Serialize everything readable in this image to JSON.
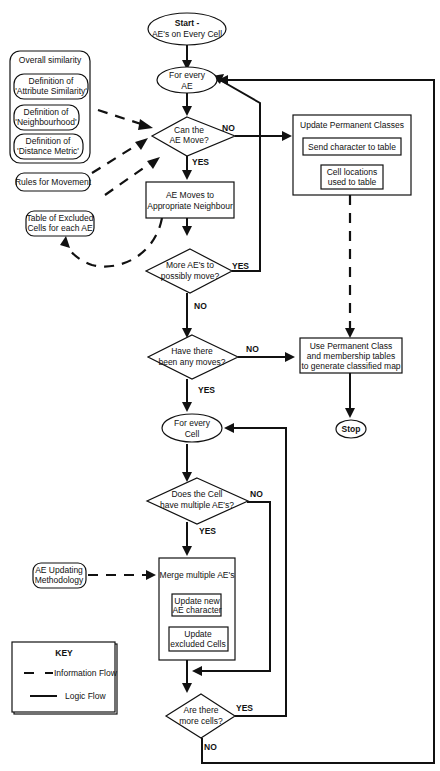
{
  "diagram": {
    "nodes": {
      "start": {
        "line1": "Start -",
        "line2": "AE's on Every Cell"
      },
      "for_every_ae": {
        "line1": "For every",
        "line2": "AE"
      },
      "can_ae_move": {
        "line1": "Can the",
        "line2": "AE Move?"
      },
      "ae_moves": {
        "line1": "AE Moves to",
        "line2": "Appropriate Neighbour"
      },
      "more_aes": {
        "line1": "More AE's to",
        "line2": "possibly move?"
      },
      "any_moves": {
        "line1": "Have there",
        "line2": "been any moves?"
      },
      "update_perm": {
        "title": "Update Permanent Classes",
        "sub1": "Send character to table",
        "sub2_line1": "Cell locations",
        "sub2_line2": "used to table"
      },
      "use_perm": {
        "line1": "Use Permanent Class",
        "line2": "and membership tables",
        "line3": "to generate classified map"
      },
      "stop": {
        "label": "Stop"
      },
      "for_every_cell": {
        "line1": "For every",
        "line2": "Cell"
      },
      "multi_aes": {
        "line1": "Does the Cell",
        "line2": "have multiple AE's?"
      },
      "merge": {
        "title": "Merge multiple AE's",
        "sub1_line1": "Update new",
        "sub1_line2": "AE character",
        "sub2_line1": "Update",
        "sub2_line2": "excluded Cells"
      },
      "more_cells": {
        "line1": "Are there",
        "line2": "more cells?"
      }
    },
    "inputs": {
      "overall": {
        "title": "Overall similarity",
        "items": [
          {
            "line1": "Definition of",
            "line2": "'Attribute Similarity'"
          },
          {
            "line1": "Definition of",
            "line2": "'Neighbourhood'"
          },
          {
            "line1": "Definition of",
            "line2": "'Distance Metric'"
          }
        ]
      },
      "rules": "Rules for Movement",
      "excluded": {
        "line1": "Table of Excluded",
        "line2": "Cells for each AE"
      },
      "ae_updating": {
        "line1": "AE Updating",
        "line2": "Methodology"
      }
    },
    "edge_labels": {
      "can_move_no": "NO",
      "can_move_yes": "YES",
      "more_aes_yes": "YES",
      "more_aes_no": "NO",
      "any_moves_no": "NO",
      "any_moves_yes": "YES",
      "multi_no": "NO",
      "multi_yes": "YES",
      "more_cells_yes": "YES",
      "more_cells_no": "NO"
    },
    "key": {
      "title": "KEY",
      "info_flow": "Information Flow",
      "logic_flow": "Logic Flow"
    }
  }
}
